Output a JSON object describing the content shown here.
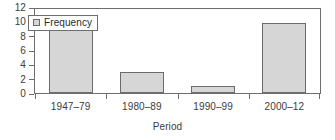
{
  "chart_data": {
    "type": "bar",
    "title": "",
    "subtitle": "",
    "categories": [
      "1947–79",
      "1980–89",
      "1990–99",
      "2000–12"
    ],
    "values": [
      9,
      3,
      1,
      10
    ],
    "series": [
      {
        "name": "Frequency",
        "values": [
          9,
          3,
          1,
          10
        ]
      }
    ],
    "xlabel": "Period",
    "ylabel": "",
    "ylim": [
      0,
      12
    ],
    "ytick_step": 2,
    "yticks": [
      0,
      2,
      4,
      6,
      8,
      10,
      12
    ],
    "ytick_labels": [
      "0",
      "2",
      "4",
      "6",
      "8",
      "10",
      "12"
    ],
    "grid": false,
    "frame": true,
    "legend": {
      "visible": true,
      "position": "top-left",
      "entries": [
        {
          "label": "Frequency",
          "swatch": "legend-swatch-icon",
          "color": "#d6d6d6"
        }
      ]
    },
    "colors": {
      "bar_fill": "#d6d6d6",
      "bar_border": "#6b6b6b",
      "axis": "#6e6e6e",
      "text": "#3c3c3c",
      "background": "#ffffff"
    }
  }
}
